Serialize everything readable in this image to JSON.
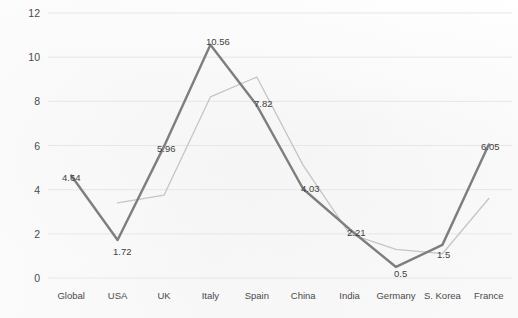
{
  "chart_data": {
    "type": "line",
    "title": "",
    "xlabel": "",
    "ylabel": "",
    "categories": [
      "Global",
      "USA",
      "UK",
      "Italy",
      "Spain",
      "China",
      "India",
      "Germany",
      "S. Korea",
      "France"
    ],
    "ylim": [
      0,
      12
    ],
    "yticks": [
      0,
      2,
      4,
      6,
      8,
      10,
      12
    ],
    "grid": true,
    "legend": "none",
    "series": [
      {
        "name": "series-primary",
        "color": "#7e7e7e",
        "labelled": true,
        "values": [
          4.64,
          1.72,
          5.96,
          10.56,
          7.82,
          4.03,
          2.21,
          0.5,
          1.5,
          6.05
        ],
        "labels": [
          "4.64",
          "1.72",
          "5.96",
          "10.56",
          "7.82",
          "4.03",
          "2.21",
          "0.5",
          "1.5",
          "6.05"
        ]
      },
      {
        "name": "series-secondary",
        "color": "#c5c5c5",
        "labelled": false,
        "values": [
          null,
          3.4,
          3.75,
          8.2,
          9.1,
          5.1,
          2.0,
          1.3,
          1.1,
          3.6
        ]
      }
    ]
  },
  "axes": {
    "y_tick_labels": [
      "12",
      "10",
      "8",
      "6",
      "4",
      "2",
      "0"
    ],
    "x_tick_labels": [
      "Global",
      "USA",
      "UK",
      "Italy",
      "Spain",
      "China",
      "India",
      "Germany",
      "S. Korea",
      "France"
    ]
  },
  "point_labels": [
    {
      "text": "4.64",
      "x": 62,
      "y": 172
    },
    {
      "text": "1.72",
      "x": 113,
      "y": 246
    },
    {
      "text": "5.96",
      "x": 157,
      "y": 143
    },
    {
      "text": "10.56",
      "x": 206,
      "y": 36
    },
    {
      "text": "7.82",
      "x": 254,
      "y": 98
    },
    {
      "text": "4.03",
      "x": 301,
      "y": 183
    },
    {
      "text": "2.21",
      "x": 347,
      "y": 227
    },
    {
      "text": "0.5",
      "x": 394,
      "y": 268
    },
    {
      "text": "1.5",
      "x": 437,
      "y": 249
    },
    {
      "text": "6.05",
      "x": 481,
      "y": 141
    }
  ]
}
